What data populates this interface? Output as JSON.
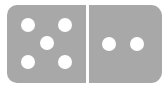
{
  "domino": {
    "left_value": 5,
    "right_value": 2,
    "tile_color": "#a8a8a8",
    "pip_color": "#ffffff",
    "left_pips": [
      {
        "x": 28,
        "y": 25
      },
      {
        "x": 65,
        "y": 25
      },
      {
        "x": 47,
        "y": 43
      },
      {
        "x": 28,
        "y": 62
      },
      {
        "x": 65,
        "y": 62
      }
    ],
    "right_pips": [
      {
        "x": 109,
        "y": 44
      },
      {
        "x": 137,
        "y": 44
      }
    ]
  }
}
